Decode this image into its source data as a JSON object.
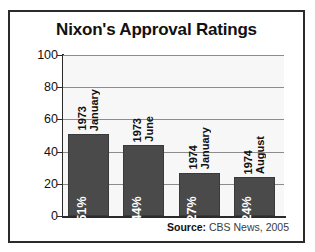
{
  "chart_data": {
    "type": "bar",
    "title": "Nixon's Approval Ratings",
    "xlabel": "",
    "ylabel": "",
    "ylim": [
      0,
      100
    ],
    "yticks": [
      0,
      20,
      40,
      60,
      80,
      100
    ],
    "ytick_labels": [
      "0",
      "20",
      "40",
      "60",
      "80",
      "100"
    ],
    "grid": true,
    "legend": "none",
    "categories": [
      "January 1973",
      "June 1973",
      "January 1974",
      "August 1974"
    ],
    "category_lines": [
      [
        "January",
        "1973"
      ],
      [
        "June",
        "1973"
      ],
      [
        "January",
        "1974"
      ],
      [
        "August",
        "1974"
      ]
    ],
    "values": [
      51,
      44,
      27,
      24
    ],
    "value_labels": [
      "51%",
      "44%",
      "27%",
      "24%"
    ],
    "bar_color": "#4a4a4a",
    "value_label_color": "#ffffff",
    "plot_background": "#f7f7f7",
    "gridline_color": "#8c8c8c",
    "axis_color": "#2b2b2b"
  },
  "source": {
    "label": "Source:",
    "text": "CBS News, 2005"
  }
}
